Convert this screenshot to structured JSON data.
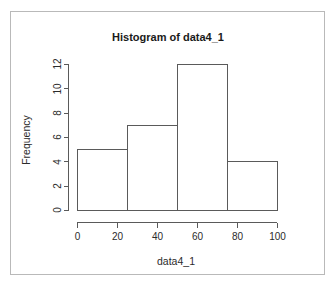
{
  "chart_data": {
    "type": "bar",
    "title": "Histogram of data4_1",
    "xlabel": "data4_1",
    "ylabel": "Frequency",
    "categories": [
      "0-25",
      "25-50",
      "50-75",
      "75-100"
    ],
    "bin_edges": [
      0,
      25,
      50,
      75,
      100
    ],
    "values": [
      5,
      7,
      12,
      4
    ],
    "xlim": [
      0,
      100
    ],
    "ylim": [
      0,
      12
    ],
    "xticks": [
      0,
      20,
      40,
      60,
      80,
      100
    ],
    "xtick_labels": [
      "0",
      "20",
      "40",
      "60",
      "80",
      "100"
    ],
    "yticks": [
      0,
      2,
      4,
      6,
      8,
      10,
      12
    ],
    "ytick_labels": [
      "0",
      "2",
      "4",
      "6",
      "8",
      "10",
      "12"
    ],
    "grid": false,
    "legend": null,
    "bar_fill_color": "#ffffff",
    "bar_stroke_color": "#5a5a5a",
    "axis_color": "#5a5a5a",
    "background_color": "#ffffff",
    "frame_border_color": "#b9b9b9"
  }
}
